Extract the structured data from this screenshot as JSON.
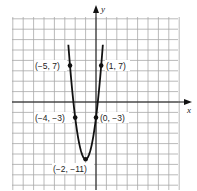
{
  "chart_data": {
    "type": "line",
    "title": "",
    "xlabel": "x",
    "ylabel": "y",
    "function": "y = 2(x+2)^2 - 11",
    "grid": true,
    "units_per_grid_cell": 2,
    "xlim": [
      -16,
      16
    ],
    "ylim": [
      -17,
      16
    ],
    "curve_range_y_max": 11,
    "points": [
      {
        "x": -5,
        "y": 7,
        "label": "(−5, 7)"
      },
      {
        "x": 1,
        "y": 7,
        "label": "(1, 7)"
      },
      {
        "x": -4,
        "y": -3,
        "label": "(−4, −3)"
      },
      {
        "x": 0,
        "y": -3,
        "label": "(0, −3)"
      },
      {
        "x": -2,
        "y": -11,
        "label": "(−2, −11)"
      }
    ],
    "colors": {
      "grid": "#9a9a9a",
      "curve": "#111111",
      "axis": "#111111"
    }
  },
  "labels": {
    "x_axis": "x",
    "y_axis": "y",
    "p1": "(−5, 7)",
    "p2": "(1, 7)",
    "p3": "(−4, −3)",
    "p4": "(0, −3)",
    "p5": "(−2, −11)"
  }
}
